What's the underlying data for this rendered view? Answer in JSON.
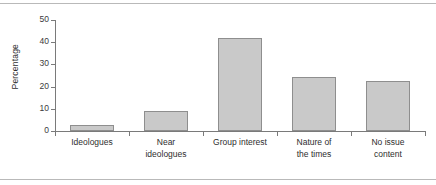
{
  "chart_data": {
    "type": "bar",
    "title": "",
    "subtitle": "",
    "xlabel": "",
    "ylabel": "Percentage",
    "categories": [
      "Ideologues",
      "Near\nideologues",
      "Group interest",
      "Nature of\nthe times",
      "No issue\ncontent"
    ],
    "values": [
      2.5,
      9.2,
      42.0,
      24.2,
      22.6
    ],
    "ylim": [
      0,
      50
    ],
    "yticks": [
      0,
      10,
      20,
      30,
      40,
      50
    ],
    "ytick_labels": [
      "0",
      "10",
      "20",
      "30",
      "40",
      "50"
    ],
    "grid": false,
    "legend": null,
    "bar_color": "#c9c9c9",
    "bar_edge_color": "#8e8e8e",
    "axis_color": "#7a7a7a",
    "rule_color": "#b9b9b9"
  }
}
